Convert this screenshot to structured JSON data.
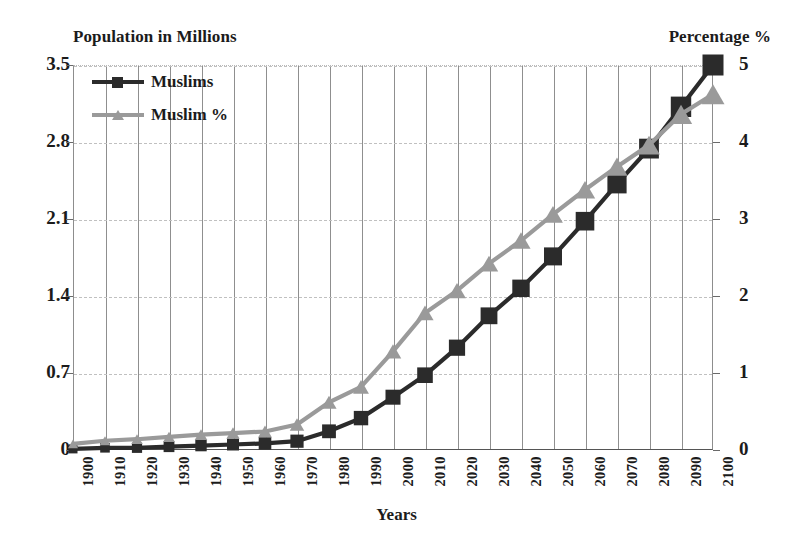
{
  "chart_data": {
    "type": "line",
    "title": "",
    "xlabel": "Years",
    "ylabel": "Population in Millions",
    "y2label": "Percentage %",
    "grid": true,
    "legend_position": "top-left",
    "x": [
      1900,
      1910,
      1920,
      1930,
      1940,
      1950,
      1960,
      1970,
      1980,
      1990,
      2000,
      2010,
      2020,
      2030,
      2040,
      2050,
      2060,
      2070,
      2080,
      2090,
      2100
    ],
    "xtick_labels": [
      "1900",
      "1910",
      "1920",
      "1930",
      "1940",
      "1950",
      "1960",
      "1970",
      "1980",
      "1990",
      "2000",
      "2010",
      "2020",
      "2030",
      "2040",
      "2050",
      "2060",
      "2070",
      "2080",
      "2090",
      "2100"
    ],
    "ytick_labels_left": [
      "0",
      "0.7",
      "1.4",
      "2.1",
      "2.8",
      "3.5"
    ],
    "ytick_values_left": [
      0,
      0.7,
      1.4,
      2.1,
      2.8,
      3.5
    ],
    "ylim": [
      0,
      3.5
    ],
    "ytick_labels_right": [
      "0",
      "1",
      "2",
      "3",
      "4",
      "5"
    ],
    "ytick_values_right": [
      0,
      1,
      2,
      3,
      4,
      5
    ],
    "y2lim": [
      0,
      5
    ],
    "series": [
      {
        "name": "Muslims",
        "axis": "left",
        "unit": "millions",
        "color": "#2b2b2b",
        "marker": "square",
        "values": [
          0.01,
          0.02,
          0.02,
          0.03,
          0.04,
          0.05,
          0.06,
          0.08,
          0.17,
          0.29,
          0.48,
          0.68,
          0.93,
          1.22,
          1.47,
          1.76,
          2.08,
          2.42,
          2.74,
          3.12,
          3.5
        ]
      },
      {
        "name": "Muslim %",
        "axis": "right",
        "unit": "percent",
        "color": "#9a9a9a",
        "marker": "triangle",
        "values": [
          0.08,
          0.12,
          0.14,
          0.17,
          0.2,
          0.22,
          0.24,
          0.33,
          0.62,
          0.82,
          1.28,
          1.78,
          2.07,
          2.42,
          2.72,
          3.06,
          3.38,
          3.68,
          3.96,
          4.36,
          4.62
        ]
      }
    ]
  },
  "legend": {
    "entries": [
      {
        "label": "Muslims"
      },
      {
        "label": "Muslim %"
      }
    ]
  },
  "axes": {
    "left_title": "Population in Millions",
    "right_title": "Percentage %",
    "bottom_title": "Years"
  }
}
